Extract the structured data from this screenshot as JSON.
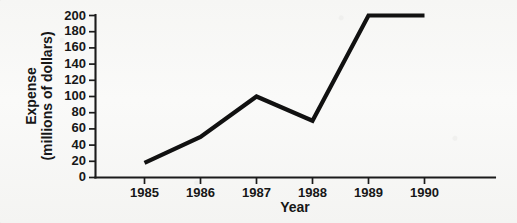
{
  "chart_data": {
    "type": "line",
    "title": "",
    "xlabel": "Year",
    "ylabel": "Expense\n(millions of dollars)",
    "ylabel_line1": "Expense",
    "ylabel_line2": "(millions of dollars)",
    "categories": [
      "1985",
      "1986",
      "1987",
      "1988",
      "1989",
      "1990"
    ],
    "x": [
      1985,
      1986,
      1987,
      1988,
      1989,
      1990
    ],
    "values": [
      18,
      50,
      100,
      70,
      200,
      200
    ],
    "series": [
      {
        "name": "Expense",
        "values": [
          18,
          50,
          100,
          70,
          200,
          200
        ]
      }
    ],
    "xlim": [
      1985,
      1990
    ],
    "ylim": [
      0,
      200
    ],
    "y_ticks": [
      0,
      20,
      40,
      60,
      80,
      100,
      120,
      140,
      160,
      180,
      200
    ],
    "y_tick_labels": [
      "0",
      "20",
      "40",
      "60",
      "80",
      "100",
      "120",
      "140",
      "160",
      "180",
      "200"
    ],
    "x_ticks": [
      1985,
      1986,
      1987,
      1988,
      1989,
      1990
    ],
    "x_tick_labels": [
      "1985",
      "1986",
      "1987",
      "1988",
      "1989",
      "1990"
    ],
    "grid": false,
    "legend": false,
    "legend_position": "none",
    "line_color": "#111111",
    "axis_color": "#1b1b1b",
    "background_color": "#fbfbfa",
    "annotations": []
  }
}
